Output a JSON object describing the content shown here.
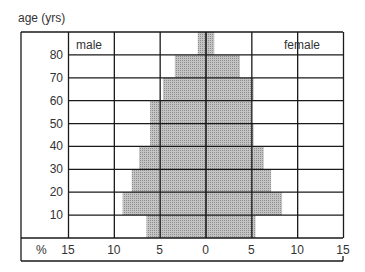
{
  "chart_data": {
    "type": "bar",
    "subtype": "population-pyramid",
    "title": "",
    "ylabel": "age (yrs)",
    "xlabel": "%",
    "series_labels": {
      "left": "male",
      "right": "female"
    },
    "age_groups": [
      "0-10",
      "10-20",
      "20-30",
      "30-40",
      "40-50",
      "50-60",
      "60-70",
      "70-80",
      "80+"
    ],
    "y_tick_labels": [
      "10",
      "20",
      "30",
      "40",
      "50",
      "60",
      "70",
      "80"
    ],
    "x_tick_labels": [
      "15",
      "10",
      "5",
      "0",
      "5",
      "10",
      "15"
    ],
    "xlim": [
      -15,
      15
    ],
    "grid": true,
    "series": [
      {
        "name": "male",
        "values": [
          6.5,
          9.1,
          8.1,
          7.3,
          6.1,
          6.1,
          4.7,
          3.4,
          0.9
        ]
      },
      {
        "name": "female",
        "values": [
          5.4,
          8.3,
          7.1,
          6.3,
          5.2,
          5.0,
          5.2,
          3.7,
          0.9
        ]
      }
    ],
    "bar_color": "#b8b8b8"
  },
  "labels": {
    "age_axis": "age (yrs)",
    "percent": "%",
    "male": "male",
    "female": "female"
  }
}
